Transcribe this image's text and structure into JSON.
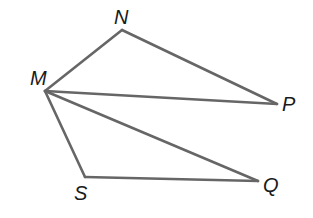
{
  "diagram": {
    "type": "geometry",
    "stroke_color": "#666666",
    "stroke_color_dark": "#555555",
    "points": {
      "M": {
        "x": 45,
        "y": 91,
        "label": "M",
        "lx": 30,
        "ly": 85
      },
      "N": {
        "x": 122,
        "y": 30,
        "label": "N",
        "lx": 114,
        "ly": 24
      },
      "P": {
        "x": 277,
        "y": 104,
        "label": "P",
        "lx": 282,
        "ly": 111
      },
      "S": {
        "x": 85,
        "y": 177,
        "label": "S",
        "lx": 74,
        "ly": 200
      },
      "Q": {
        "x": 258,
        "y": 181,
        "label": "Q",
        "lx": 263,
        "ly": 192
      }
    },
    "segments": [
      {
        "from": "M",
        "to": "N"
      },
      {
        "from": "N",
        "to": "P"
      },
      {
        "from": "M",
        "to": "P"
      },
      {
        "from": "M",
        "to": "Q"
      },
      {
        "from": "M",
        "to": "S"
      },
      {
        "from": "S",
        "to": "Q"
      }
    ],
    "triangles": [
      [
        "M",
        "N",
        "P"
      ],
      [
        "M",
        "S",
        "Q"
      ]
    ]
  }
}
